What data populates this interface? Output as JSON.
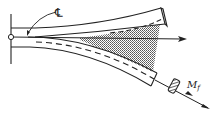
{
  "diagram": {
    "type": "cantilever-beam-deflection",
    "labels": {
      "centerline": "℄",
      "moment": "M",
      "moment_subscript": "f"
    },
    "elements": [
      {
        "name": "fixed-support-wall",
        "description": "vertical support line with hinge circle at root"
      },
      {
        "name": "undeformed-beam",
        "description": "upper beam, slightly curved upward, with end cap"
      },
      {
        "name": "deformed-beam",
        "description": "lower beam bent downward with dashed centerline"
      },
      {
        "name": "displacement-region",
        "description": "shaded region between undeformed and deformed beam"
      },
      {
        "name": "reference-axis-arrow",
        "description": "horizontal arrow from root to beyond tip"
      },
      {
        "name": "applied-moment",
        "description": "double-headed moment vector with hatched cylinder at deformed tip"
      }
    ],
    "colors": {
      "line": "#222222",
      "shade": "#9a9a9a",
      "background": "#ffffff"
    }
  }
}
